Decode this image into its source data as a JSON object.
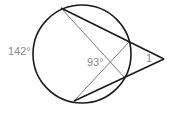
{
  "diagram": {
    "type": "circle-secants-angle",
    "labels": {
      "arc_left": "142°",
      "chord_angle": "93°",
      "exterior_angle": "1"
    },
    "colors": {
      "circle": "#1a1a1a",
      "secant": "#1a1a1a",
      "chord": "#7a7a7a",
      "label": "#8a8a8a",
      "background": "#ffffff"
    }
  }
}
